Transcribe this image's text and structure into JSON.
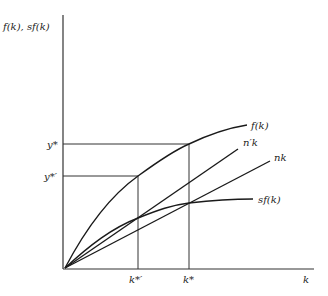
{
  "diagram": {
    "y_axis_label": "f(k), sf(k)",
    "x_axis_label": "k",
    "curves": [
      {
        "id": "f",
        "label": "f(k)",
        "type": "concave"
      },
      {
        "id": "nprime",
        "label": "n′k",
        "type": "line"
      },
      {
        "id": "n",
        "label": "nk",
        "type": "line"
      },
      {
        "id": "sf",
        "label": "sf(k)",
        "type": "concave"
      }
    ],
    "y_ticks": [
      {
        "label": "y*"
      },
      {
        "label": "y*′"
      }
    ],
    "x_ticks": [
      {
        "label": "k*′"
      },
      {
        "label": "k*"
      }
    ]
  }
}
